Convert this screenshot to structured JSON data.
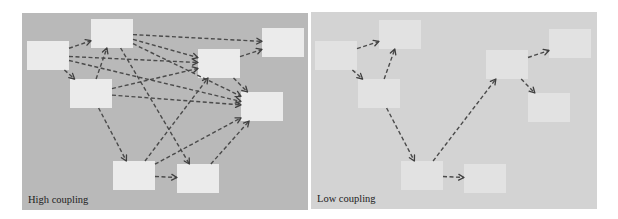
{
  "diagrams": [
    {
      "id": "high",
      "caption": "High coupling",
      "background": "#b9b9b9",
      "box_color": "#ebebeb",
      "boxes": {
        "A": [
          27,
          41
        ],
        "B": [
          91,
          19
        ],
        "C": [
          70,
          79
        ],
        "D": [
          198,
          49
        ],
        "E": [
          262,
          28
        ],
        "F": [
          241,
          92
        ],
        "G": [
          113,
          161
        ],
        "H": [
          177,
          164
        ]
      },
      "edges": [
        [
          "A",
          "B"
        ],
        [
          "A",
          "C"
        ],
        [
          "A",
          "D"
        ],
        [
          "A",
          "F"
        ],
        [
          "C",
          "B"
        ],
        [
          "C",
          "D"
        ],
        [
          "C",
          "F"
        ],
        [
          "C",
          "G"
        ],
        [
          "B",
          "E"
        ],
        [
          "B",
          "D"
        ],
        [
          "B",
          "F"
        ],
        [
          "B",
          "H"
        ],
        [
          "G",
          "D"
        ],
        [
          "G",
          "F"
        ],
        [
          "H",
          "F"
        ],
        [
          "G",
          "H"
        ],
        [
          "D",
          "E"
        ],
        [
          "D",
          "F"
        ]
      ]
    },
    {
      "id": "low",
      "caption": "Low coupling",
      "background": "#d3d3d3",
      "box_color": "#e2e2e2",
      "boxes": {
        "A": [
          315,
          41
        ],
        "B": [
          379,
          20
        ],
        "C": [
          358,
          79
        ],
        "D": [
          486,
          50
        ],
        "E": [
          549,
          29
        ],
        "F": [
          528,
          93
        ],
        "G": [
          401,
          161
        ],
        "H": [
          464,
          164
        ]
      },
      "edges": [
        [
          "A",
          "B"
        ],
        [
          "A",
          "C"
        ],
        [
          "C",
          "B"
        ],
        [
          "C",
          "G"
        ],
        [
          "G",
          "D"
        ],
        [
          "G",
          "H"
        ],
        [
          "D",
          "E"
        ],
        [
          "D",
          "F"
        ]
      ]
    }
  ]
}
